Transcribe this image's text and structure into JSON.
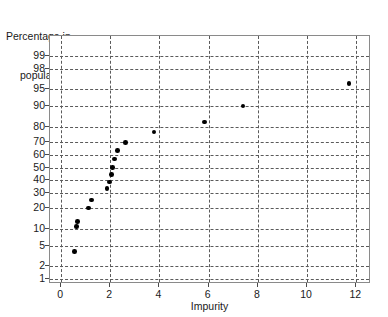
{
  "chart_data": {
    "type": "scatter",
    "title": "",
    "ylabel": "Percentage in population",
    "ylabel_line1": "Percentage in",
    "ylabel_line2": "population",
    "xlabel": "Impurity",
    "xlim": [
      -0.45,
      12.6
    ],
    "ylim_percent": [
      0.75,
      99.7
    ],
    "scale": "normal-probability",
    "grid": true,
    "legend": "none",
    "marker": "filled-circle",
    "marker_color": "#000000",
    "xticks": [
      0,
      2,
      4,
      6,
      8,
      10,
      12
    ],
    "xtick_labels": [
      "0",
      "2",
      "4",
      "6",
      "8",
      "10",
      "12"
    ],
    "yticks": [
      1,
      2,
      5,
      10,
      20,
      30,
      40,
      50,
      60,
      70,
      80,
      90,
      95,
      98,
      99
    ],
    "ytick_labels": [
      "1",
      "2",
      "5",
      "10",
      "20",
      "30",
      "40",
      "50",
      "60",
      "70",
      "80",
      "90",
      "95",
      "98",
      "99"
    ],
    "points": [
      {
        "x": 0.55,
        "y": 4
      },
      {
        "x": 0.62,
        "y": 11
      },
      {
        "x": 0.66,
        "y": 13
      },
      {
        "x": 1.12,
        "y": 20
      },
      {
        "x": 1.24,
        "y": 25
      },
      {
        "x": 1.86,
        "y": 33
      },
      {
        "x": 1.98,
        "y": 38
      },
      {
        "x": 2.04,
        "y": 44
      },
      {
        "x": 2.08,
        "y": 50
      },
      {
        "x": 2.18,
        "y": 57
      },
      {
        "x": 2.3,
        "y": 64
      },
      {
        "x": 2.62,
        "y": 70
      },
      {
        "x": 3.78,
        "y": 77
      },
      {
        "x": 5.82,
        "y": 83
      },
      {
        "x": 7.4,
        "y": 90
      },
      {
        "x": 11.7,
        "y": 96
      }
    ],
    "axis_color": "#8a8a8a",
    "grid_color": "#5a5a5a",
    "background": "#ffffff"
  }
}
